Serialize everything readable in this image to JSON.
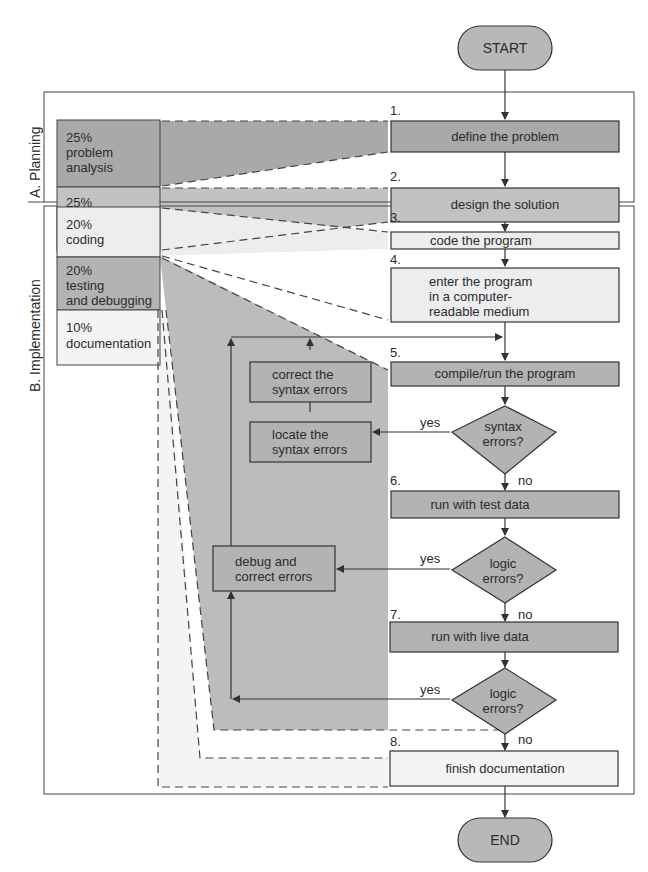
{
  "terminals": {
    "start": "START",
    "end": "END"
  },
  "phases": [
    {
      "label": "A. Planning"
    },
    {
      "label": "B. Implementation"
    }
  ],
  "allocation": [
    {
      "pct": "25%",
      "line1": "problem",
      "line2": "analysis",
      "color": "#a9a9a9"
    },
    {
      "pct": "25%",
      "line1": "program",
      "line2": "design",
      "color": "#bdbdbd"
    },
    {
      "pct": "20%",
      "line1": "coding",
      "line2": "",
      "color": "#ededed"
    },
    {
      "pct": "20%",
      "line1": "testing",
      "line2": "and debugging",
      "color": "#b3b3b3"
    },
    {
      "pct": "10%",
      "line1": "documentation",
      "line2": "",
      "color": "#f4f4f4"
    }
  ],
  "steps": [
    {
      "num": "1.",
      "label": "define the problem"
    },
    {
      "num": "2.",
      "label": "design the solution"
    },
    {
      "num": "3.",
      "label": "code the program"
    },
    {
      "num": "4.",
      "line1": "enter the program",
      "line2": "in a computer-",
      "line3": "readable medium"
    },
    {
      "num": "5.",
      "label": "compile/run the program"
    },
    {
      "num": "6.",
      "label": "run with test data"
    },
    {
      "num": "7.",
      "label": "run with live data"
    },
    {
      "num": "8.",
      "label": "finish documentation"
    }
  ],
  "decisions": [
    {
      "line1": "syntax",
      "line2": "errors?"
    },
    {
      "line1": "logic",
      "line2": "errors?"
    },
    {
      "line1": "logic",
      "line2": "errors?"
    }
  ],
  "side_boxes": {
    "correct": {
      "line1": "correct the",
      "line2": "syntax errors"
    },
    "locate": {
      "line1": "locate the",
      "line2": "syntax errors"
    },
    "debug": {
      "line1": "debug and",
      "line2": "correct errors"
    }
  },
  "branch_labels": {
    "yes": "yes",
    "no": "no"
  },
  "colors": {
    "line": "#333333",
    "planning_dark": "#a9a9a9",
    "planning_mid": "#bdbdbd",
    "coding_light": "#ededed",
    "testing_gray": "#bcbcbc",
    "doc_light": "#f4f4f4"
  }
}
